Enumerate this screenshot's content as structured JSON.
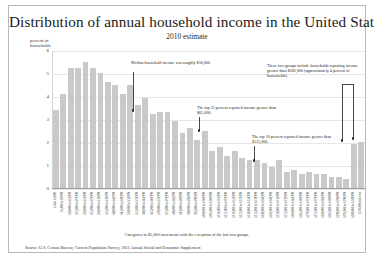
{
  "chart_data": {
    "type": "bar",
    "title": "Distribution of annual household income in the United States",
    "subtitle": "2010 estimate",
    "xlabel": "",
    "ylabel": "percent of households",
    "ylim": [
      0,
      6
    ],
    "yticks": [
      "0",
      "1",
      "2",
      "3",
      "4",
      "5",
      "6"
    ],
    "grid": true,
    "legend": "none",
    "categories": [
      "Under $5,000",
      "$5,000 to $9,999",
      "$10,000 to $14,999",
      "$15,000 to $19,999",
      "$20,000 to $24,999",
      "$25,000 to $29,999",
      "$30,000 to $34,999",
      "$35,000 to $39,999",
      "$40,000 to $44,999",
      "$45,000 to $49,999",
      "$50,000 to $54,999",
      "$55,000 to $59,999",
      "$60,000 to $64,999",
      "$65,000 to $69,999",
      "$70,000 to $74,999",
      "$75,000 to $79,999",
      "$80,000 to $84,999",
      "$85,000 to $89,999",
      "$90,000 to $94,999",
      "$95,000 to $99,999",
      "$100,000 to $104,999",
      "$105,000 to $109,999",
      "$110,000 to $114,999",
      "$115,000 to $119,999",
      "$120,000 to $124,999",
      "$125,000 to $129,999",
      "$130,000 to $134,999",
      "$135,000 to $139,999",
      "$140,000 to $144,999",
      "$145,000 to $149,999",
      "$150,000 to $154,999",
      "$155,000 to $159,999",
      "$160,000 to $164,999",
      "$165,000 to $169,999",
      "$170,000 to $174,999",
      "$175,000 to $179,999",
      "$180,000 to $184,999",
      "$185,000 to $189,999",
      "$190,000 to $194,999",
      "$195,000 to $199,999",
      "$200,000 to $249,999",
      "$250,000 and over"
    ],
    "values": [
      3.4,
      4.1,
      5.2,
      5.2,
      5.5,
      5.2,
      5.0,
      4.6,
      4.5,
      4.1,
      4.5,
      3.6,
      3.9,
      3.2,
      3.3,
      3.3,
      2.9,
      2.4,
      2.6,
      2.1,
      2.5,
      1.6,
      1.8,
      1.4,
      1.6,
      1.3,
      1.2,
      1.2,
      1.1,
      0.9,
      1.2,
      0.7,
      0.8,
      0.6,
      0.7,
      0.6,
      0.6,
      0.5,
      0.5,
      0.4,
      1.9,
      2.0
    ]
  },
  "annotations": {
    "median": "Median household income was roughly $50,000.",
    "top25": "The top 25 percent reported income greater than $65,000.",
    "top10": "The top 10 percent reported income greater than $135,000.",
    "top_groups": "These two groups include households reporting income greater than $200,000 (approximately 4 percent of households)."
  },
  "caption": "Categories in $5,000 increments with the exception of the last two groups.",
  "source": "Source: U.S. Census Bureau, Current Population Survey, 2011 Annual Social and Economic Supplement",
  "colors": {
    "bar": "#c9c9c9",
    "grid": "#e6e6e6",
    "axis": "#9a9a9a",
    "text": "#1f1f1f",
    "border": "#b9b9b9"
  }
}
